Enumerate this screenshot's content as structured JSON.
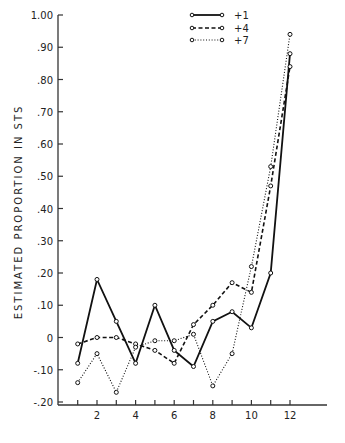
{
  "chart_data": {
    "type": "line",
    "title": "",
    "xlabel": "",
    "ylabel": "ESTIMATED PROPORTION IN STS",
    "x": [
      1,
      2,
      3,
      4,
      5,
      6,
      7,
      8,
      9,
      10,
      11,
      12
    ],
    "x_tick_labels": [
      "2",
      "4",
      "6",
      "8",
      "10",
      "12"
    ],
    "x_tick_values": [
      2,
      4,
      6,
      8,
      10,
      12
    ],
    "y_tick_labels": [
      "1.00",
      ".90",
      ".80",
      ".70",
      ".60",
      ".50",
      ".40",
      ".30",
      ".20",
      ".10",
      "0",
      "-.10",
      "-.20"
    ],
    "y_tick_values": [
      1.0,
      0.9,
      0.8,
      0.7,
      0.6,
      0.5,
      0.4,
      0.3,
      0.2,
      0.1,
      0.0,
      -0.1,
      -0.2
    ],
    "ylim": [
      -0.2,
      1.0
    ],
    "xlim": [
      0,
      14
    ],
    "grid": false,
    "legend_position": "top-center",
    "series": [
      {
        "name": "+1",
        "style": "solid",
        "values": [
          -0.08,
          0.18,
          0.05,
          -0.08,
          0.1,
          -0.04,
          -0.09,
          0.05,
          0.08,
          0.03,
          0.2,
          0.88
        ]
      },
      {
        "name": "+4",
        "style": "dashed",
        "values": [
          -0.02,
          0.0,
          0.0,
          -0.02,
          -0.04,
          -0.08,
          0.04,
          0.1,
          0.17,
          0.14,
          0.47,
          0.84
        ]
      },
      {
        "name": "+7",
        "style": "dotted",
        "values": [
          -0.14,
          -0.05,
          -0.17,
          -0.03,
          -0.01,
          -0.01,
          0.01,
          -0.15,
          -0.05,
          0.22,
          0.53,
          0.94
        ]
      }
    ]
  }
}
